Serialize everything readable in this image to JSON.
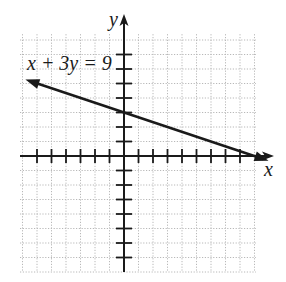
{
  "chart_data": {
    "type": "line",
    "title": "",
    "xlabel": "x",
    "ylabel": "y",
    "xlim": [
      -7,
      9
    ],
    "ylim": [
      -8,
      8
    ],
    "grid": true,
    "grid_style": "dotted",
    "tick_spacing": 1,
    "tick_labels_shown": false,
    "series": [
      {
        "name": "x + 3y = 9",
        "equation": "x + 3y = 9",
        "slope": -0.3333,
        "y_intercept": 3,
        "x_intercept": 9,
        "points": [
          [
            -6.8,
            5.27
          ],
          [
            0,
            3
          ],
          [
            9,
            0
          ]
        ],
        "arrows": "both"
      }
    ],
    "annotations": [
      {
        "text": "x + 3y = 9",
        "x": -6.5,
        "y": 6.5
      }
    ]
  },
  "labels": {
    "x_axis": "x",
    "y_axis": "y",
    "equation": "x + 3y = 9"
  },
  "colors": {
    "axis": "#1a1a1a",
    "grid": "#b8b8b8",
    "line": "#1a1a1a"
  }
}
